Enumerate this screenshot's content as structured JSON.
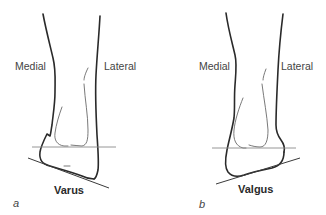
{
  "figure": {
    "panels": [
      {
        "id": "a",
        "letter": "a",
        "caption": "Varus",
        "medial_label": "Medial",
        "lateral_label": "Lateral"
      },
      {
        "id": "b",
        "letter": "b",
        "caption": "Valgus",
        "medial_label": "Medial",
        "lateral_label": "Lateral"
      }
    ],
    "colors": {
      "outline": "#2a2a2a",
      "inner": "#6a6a6a",
      "reference_line": "#8a8a8a",
      "text": "#444444"
    }
  }
}
